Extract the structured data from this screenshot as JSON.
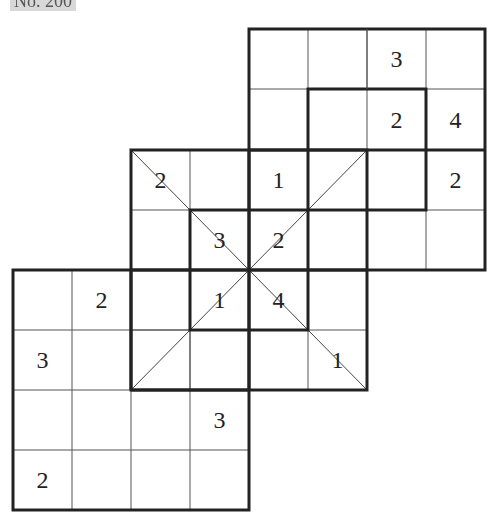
{
  "title": "No. 200",
  "puzzle": {
    "type": "overlapping diagonal sudoku (4x4 grids)",
    "cell_size": 59,
    "col_lines": [
      13,
      72,
      131,
      190,
      249,
      308,
      367,
      426,
      485
    ],
    "row_lines": [
      29,
      89,
      150,
      210,
      270,
      330,
      390,
      450,
      510
    ],
    "grids": [
      {
        "name": "top-grid",
        "col": 4,
        "row": 0,
        "size": 4
      },
      {
        "name": "middle-grid",
        "col": 2,
        "row": 2,
        "size": 4
      },
      {
        "name": "bottom-grid",
        "col": 0,
        "row": 4,
        "size": 4
      }
    ],
    "inner_boxes": [
      {
        "name": "top-inner-box",
        "col": 5,
        "row": 1,
        "size": 2
      },
      {
        "name": "center-inner-box",
        "col": 3,
        "row": 3,
        "size": 2
      }
    ],
    "givens": [
      {
        "col": 6,
        "row": 0,
        "value": "3"
      },
      {
        "col": 6,
        "row": 1,
        "value": "2"
      },
      {
        "col": 7,
        "row": 1,
        "value": "4"
      },
      {
        "col": 2,
        "row": 2,
        "value": "2"
      },
      {
        "col": 4,
        "row": 2,
        "value": "1"
      },
      {
        "col": 7,
        "row": 2,
        "value": "2"
      },
      {
        "col": 3,
        "row": 3,
        "value": "3"
      },
      {
        "col": 4,
        "row": 3,
        "value": "2"
      },
      {
        "col": 1,
        "row": 4,
        "value": "2"
      },
      {
        "col": 3,
        "row": 4,
        "value": "1"
      },
      {
        "col": 4,
        "row": 4,
        "value": "4"
      },
      {
        "col": 0,
        "row": 5,
        "value": "3"
      },
      {
        "col": 5,
        "row": 5,
        "value": "1"
      },
      {
        "col": 3,
        "row": 6,
        "value": "3"
      },
      {
        "col": 0,
        "row": 7,
        "value": "2"
      }
    ]
  }
}
